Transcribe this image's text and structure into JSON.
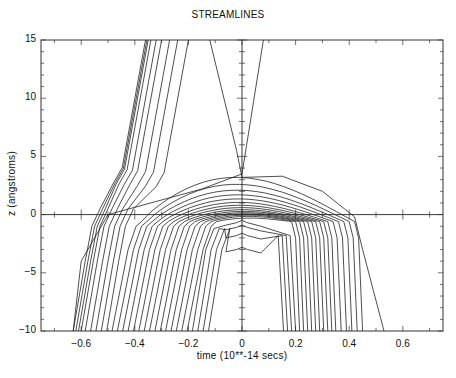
{
  "chart_data": {
    "type": "line",
    "title": "STREAMLINES",
    "xlabel": "time (10**-14 secs)",
    "ylabel": "z (angstroms)",
    "xlim": [
      -0.75,
      0.75
    ],
    "ylim": [
      -10,
      15
    ],
    "grid": false,
    "legend": null,
    "x_ticks": [
      -0.6,
      -0.4,
      -0.2,
      0,
      0.2,
      0.4,
      0.6
    ],
    "x_tick_labels": [
      "-0.6",
      "-0.4",
      "-0.2",
      "0",
      "0.2",
      "0.4",
      "0.6"
    ],
    "y_ticks": [
      -10,
      -5,
      0,
      5,
      10,
      15
    ],
    "y_tick_labels": [
      "-10",
      "-5",
      "0",
      "5",
      "10",
      "15"
    ],
    "reference_lines": {
      "horizontal_z": 0,
      "vertical_t": 0
    },
    "series_groups": [
      {
        "name": "transmitted streamlines (pass through barrier, exit top)",
        "start_t_at_z_minus10": [
          -0.63,
          -0.62,
          -0.61,
          -0.6,
          -0.585,
          -0.565,
          -0.545,
          -0.525,
          -0.505
        ],
        "end_t_at_z_15": [
          -0.36,
          -0.355,
          -0.35,
          -0.34,
          -0.32,
          -0.3,
          -0.27,
          -0.24,
          -0.2
        ],
        "knee_z": 4.0
      },
      {
        "name": "reflected streamlines (turn back at barrier, return to bottom)",
        "start_t_at_z_minus10": [
          -0.485,
          -0.465,
          -0.445,
          -0.425,
          -0.405,
          -0.385,
          -0.365,
          -0.345,
          -0.325,
          -0.305,
          -0.285,
          -0.265,
          -0.245,
          -0.225,
          -0.205,
          -0.185,
          -0.165,
          -0.145,
          -0.125
        ],
        "end_t_at_z_minus10": [
          0.45,
          0.43,
          0.41,
          0.39,
          0.37,
          0.35,
          0.335,
          0.32,
          0.305,
          0.29,
          0.275,
          0.26,
          0.245,
          0.23,
          0.215,
          0.2,
          0.185,
          0.17,
          0.155
        ],
        "apex_z": [
          3.2,
          2.6,
          2.1,
          1.7,
          1.35,
          1.05,
          0.8,
          0.6,
          0.42,
          0.28,
          0.16,
          0.06,
          -0.04,
          -0.15,
          -0.3,
          -0.5,
          -0.9,
          -1.6,
          -2.8
        ]
      },
      {
        "name": "outermost streamline",
        "points": [
          [
            -0.12,
            15
          ],
          [
            -0.02,
            5.5
          ],
          [
            0.0,
            3.2
          ],
          [
            0.15,
            3.3
          ],
          [
            0.3,
            2.0
          ],
          [
            0.42,
            -0.2
          ],
          [
            0.45,
            -3
          ],
          [
            0.53,
            -10
          ]
        ]
      },
      {
        "name": "near-axis transmitted streamline",
        "points": [
          [
            0.08,
            15
          ],
          [
            0.0,
            3.5
          ],
          [
            -0.15,
            2.2
          ],
          [
            -0.5,
            0.0
          ],
          [
            -0.6,
            -4
          ],
          [
            -0.63,
            -10
          ]
        ]
      }
    ]
  }
}
